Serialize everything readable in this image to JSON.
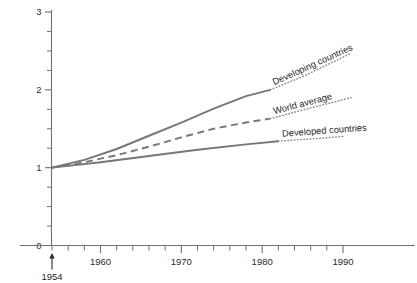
{
  "chart_data": {
    "type": "line",
    "title": "",
    "xlabel": "",
    "ylabel": "",
    "xlim": [
      1953,
      1997
    ],
    "ylim": [
      0,
      3
    ],
    "grid": false,
    "legend_position": "inline-labels-along-curves",
    "y_ticks": [
      "0",
      "1",
      "2",
      "3"
    ],
    "y_tick_values": [
      0,
      1,
      2,
      3
    ],
    "y_minor_tick_step": 0.25,
    "x_ticks": [
      "1960",
      "1970",
      "1980",
      "1990"
    ],
    "x_tick_values": [
      1960,
      1970,
      1980,
      1990
    ],
    "x_minor_tick_step": 2,
    "baseline_year": 1954,
    "baseline_value": 1,
    "annotation": {
      "label": "1954",
      "year": 1954,
      "type": "arrow-up"
    },
    "series": [
      {
        "name": "Developing countries",
        "style": "solid",
        "label": "Developing countries",
        "x": [
          1954,
          1958,
          1962,
          1966,
          1970,
          1974,
          1978,
          1981
        ],
        "values": [
          1.0,
          1.1,
          1.24,
          1.41,
          1.58,
          1.76,
          1.92,
          2.0
        ],
        "extension_style": "dotted",
        "extension_x": [
          1981,
          1985,
          1988,
          1991
        ],
        "extension_values": [
          2.0,
          2.17,
          2.32,
          2.47
        ]
      },
      {
        "name": "World average",
        "style": "dashed",
        "label": "World average",
        "x": [
          1954,
          1958,
          1962,
          1966,
          1970,
          1974,
          1978,
          1981
        ],
        "values": [
          1.0,
          1.07,
          1.16,
          1.27,
          1.39,
          1.5,
          1.58,
          1.63
        ],
        "extension_style": "dotted",
        "extension_x": [
          1981,
          1985,
          1988,
          1991
        ],
        "extension_values": [
          1.63,
          1.74,
          1.82,
          1.9
        ]
      },
      {
        "name": "Developed countries",
        "style": "solid",
        "label": "Developed countries",
        "x": [
          1954,
          1960,
          1966,
          1972,
          1978,
          1982
        ],
        "values": [
          1.0,
          1.07,
          1.15,
          1.23,
          1.3,
          1.34
        ],
        "extension_style": "dotted",
        "extension_x": [
          1982,
          1986,
          1990
        ],
        "extension_values": [
          1.34,
          1.37,
          1.4
        ]
      }
    ]
  }
}
